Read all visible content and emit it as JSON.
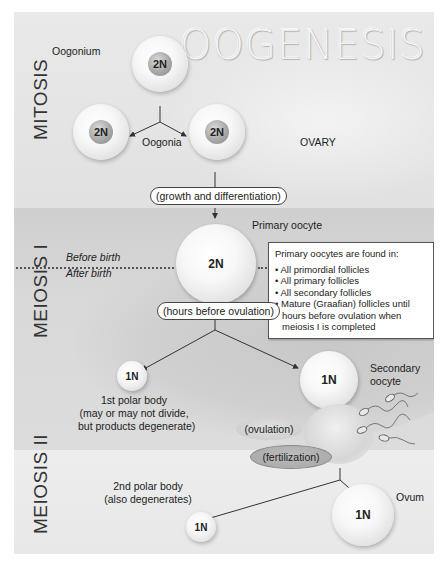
{
  "title": "OOGENESIS",
  "stages": {
    "mitosis": "MITOSIS",
    "meiosis1": "MEIOSIS I",
    "meiosis2": "MEIOSIS II"
  },
  "labels": {
    "oogonium": "Oogonium",
    "oogonia": "Oogonia",
    "ovary": "OVARY",
    "primary_oocyte": "Primary oocyte",
    "before_birth": "Before birth",
    "after_birth": "After birth",
    "secondary_oocyte_1": "Secondary",
    "secondary_oocyte_2": "oocyte",
    "first_polar_1": "1st polar body",
    "first_polar_2": "(may or may not divide,",
    "first_polar_3": "but products degenerate)",
    "second_polar_1": "2nd polar body",
    "second_polar_2": "(also degenerates)",
    "ovum": "Ovum"
  },
  "process_labels": {
    "growth": "(growth and differentiation)",
    "hours_before": "(hours before ovulation)",
    "ovulation": "(ovulation)",
    "fertilization": "(fertilization)"
  },
  "cells": {
    "oogonium": "2N",
    "oogonia_left": "2N",
    "oogonia_right": "2N",
    "primary_oocyte": "2N",
    "first_polar": "1N",
    "secondary_oocyte": "1N",
    "second_polar": "1N",
    "ovum": "1N"
  },
  "infobox": {
    "heading": "Primary oocytes are found in:",
    "items": [
      "All primordial follicles",
      "All primary follicles",
      "All secondary follicles",
      "Mature (Graafian) follicles until hours before ovulation when meiosis I is completed"
    ]
  }
}
